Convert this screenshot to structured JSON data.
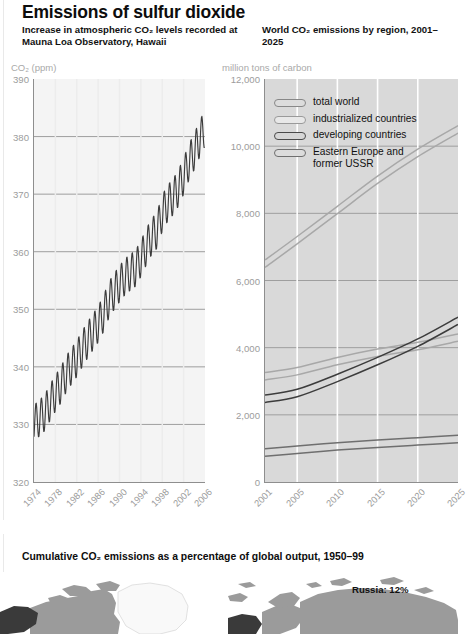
{
  "header": {
    "main_title": "Emissions of sulfur dioxide",
    "subtitle_left": "Increase in atmospheric CO₂ levels recorded at Mauna Loa Observatory, Hawaii",
    "subtitle_right": "World CO₂ emissions by region, 2001–2025"
  },
  "colors": {
    "plot_left_bg": "#f4f4f4",
    "plot_right_bg": "#d9d9d9",
    "gridline": "#9e9e9e",
    "tick_text": "#9c9c9c",
    "series_dark": "#3c3c3c",
    "series_mid": "#6f6f6f",
    "series_light": "#a8a8a8",
    "map_land": "#9b9b9b",
    "map_dark": "#3a3a3a",
    "map_white": "#f7f7f7"
  },
  "chart_data": [
    {
      "id": "mauna-loa",
      "type": "line",
      "title": "Increase in atmospheric CO₂ levels recorded at Mauna Loa Observatory, Hawaii",
      "xlabel": "",
      "ylabel": "CO₂ (ppm)",
      "unit_label": "CO₂ (ppm)",
      "xlim": [
        1974,
        2006
      ],
      "ylim": [
        320,
        390
      ],
      "yticks": [
        320,
        330,
        340,
        350,
        360,
        370,
        380,
        390
      ],
      "xticks": [
        1974,
        1978,
        1982,
        1986,
        1990,
        1994,
        1998,
        2002,
        2006
      ],
      "grid": true,
      "legend": "none",
      "series": [
        {
          "name": "atmospheric CO2 (annual mean, ppm)",
          "color": "#3c3c3c",
          "seasonal_amplitude_ppm": 3.2,
          "x": [
            1974,
            1975,
            1976,
            1977,
            1978,
            1979,
            1980,
            1981,
            1982,
            1983,
            1984,
            1985,
            1986,
            1987,
            1988,
            1989,
            1990,
            1991,
            1992,
            1993,
            1994,
            1995,
            1996,
            1997,
            1998,
            1999,
            2000,
            2001,
            2002,
            2003,
            2004,
            2005
          ],
          "values": [
            330.2,
            331.1,
            332.0,
            333.8,
            335.4,
            336.8,
            338.7,
            340.1,
            341.4,
            343.1,
            344.6,
            346.0,
            347.4,
            349.2,
            351.6,
            353.1,
            354.4,
            355.6,
            356.4,
            357.1,
            358.8,
            360.8,
            362.6,
            363.7,
            366.7,
            368.4,
            369.5,
            371.0,
            373.1,
            375.6,
            377.4,
            379.6
          ]
        }
      ]
    },
    {
      "id": "co2-by-region",
      "type": "line",
      "title": "World CO₂ emissions by region, 2001–2025",
      "xlabel": "",
      "ylabel": "million tons of carbon",
      "unit_label": "million tons of carbon",
      "xlim": [
        2001,
        2025
      ],
      "ylim": [
        0,
        12000
      ],
      "yticks": [
        0,
        2000,
        4000,
        6000,
        8000,
        10000,
        12000
      ],
      "ytick_labels": [
        "0",
        "2,000",
        "4,000",
        "6,000",
        "8,000",
        "10,000",
        "12,000"
      ],
      "xticks": [
        2001,
        2005,
        2010,
        2015,
        2020,
        2025
      ],
      "grid": true,
      "legend_position": "top-left",
      "x": [
        2001,
        2005,
        2010,
        2015,
        2020,
        2025
      ],
      "series": [
        {
          "name": "total world",
          "color": "#a8a8a8",
          "values": [
            6500,
            7200,
            8100,
            9000,
            9800,
            10500
          ]
        },
        {
          "name": "industrialized countries",
          "color": "#a8a8a8",
          "values": [
            3150,
            3300,
            3600,
            3850,
            4050,
            4300
          ]
        },
        {
          "name": "developing countries",
          "color": "#3c3c3c",
          "values": [
            2480,
            2650,
            3100,
            3600,
            4150,
            4800
          ]
        },
        {
          "name": "Eastern Europe and former USSR",
          "color": "#6f6f6f",
          "values": [
            880,
            960,
            1060,
            1140,
            1210,
            1280
          ]
        }
      ]
    }
  ],
  "legend": {
    "items": [
      {
        "label": "total world",
        "swatch": "sw-total"
      },
      {
        "label": "industrialized countries",
        "swatch": "sw-ind"
      },
      {
        "label": "developing countries",
        "swatch": "sw-dev"
      },
      {
        "label": "Eastern Europe and\nformer USSR",
        "swatch": "sw-eeu"
      }
    ]
  },
  "map_section": {
    "title": "Cumulative CO₂ emissions as a percentage of global output, 1950–99",
    "annotation": "Russia: 12%"
  }
}
